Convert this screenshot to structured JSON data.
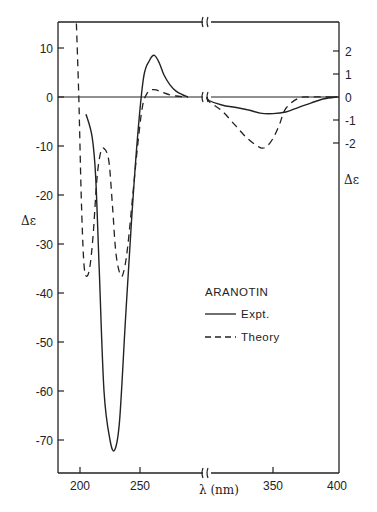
{
  "chart_data": {
    "type": "line",
    "title": "ARANOTIN",
    "xlabel": "λ (nm)",
    "ylabel": "Δε",
    "ylabel_right": "Δε",
    "xlim": [
      182,
      402
    ],
    "x_axis_break": 290,
    "x_ticks": [
      200,
      250,
      350,
      400
    ],
    "x_tick_labels": [
      "200",
      "250",
      "350",
      "400"
    ],
    "ylim_left": [
      -75,
      15
    ],
    "y_ticks_left": [
      10,
      0,
      -10,
      -20,
      -30,
      -40,
      -50,
      -60,
      -70
    ],
    "y_tick_labels_left": [
      "10",
      "0",
      "-10",
      "-20",
      "-30",
      "-40",
      "-50",
      "-60",
      "-70"
    ],
    "ylim_right": [
      -3,
      3
    ],
    "y_ticks_right": [
      2,
      1,
      0,
      -1,
      -2
    ],
    "y_tick_labels_right": [
      "2",
      "1",
      "0",
      "-1",
      "-2"
    ],
    "right_axis_applies_to": "λ > 290 nm (after axis break)",
    "grid": false,
    "legend_position": "inside lower-right",
    "legend_title": "ARANOTIN",
    "series": [
      {
        "name": "Expt.",
        "style": "solid",
        "x_left": [
          205,
          210,
          213,
          216,
          220,
          225,
          229,
          233,
          238,
          243,
          248,
          253,
          258,
          262,
          266,
          270,
          275,
          280,
          285,
          290
        ],
        "y_left": [
          -3.5,
          -8,
          -16,
          -35,
          -60,
          -70,
          -72,
          -66,
          -45,
          -25,
          -8,
          4,
          7.5,
          8.5,
          7,
          4.5,
          2.5,
          1.2,
          0.5,
          0
        ],
        "x_right": [
          290,
          300,
          310,
          320,
          330,
          340,
          350,
          360,
          370,
          380,
          390,
          400
        ],
        "y_right": [
          0,
          -0.15,
          -0.35,
          -0.45,
          -0.55,
          -0.7,
          -0.72,
          -0.65,
          -0.45,
          -0.25,
          -0.08,
          0
        ]
      },
      {
        "name": "Theory",
        "style": "dashed",
        "x_left": [
          197,
          199,
          201,
          203,
          205,
          208,
          211,
          214,
          217,
          220,
          224,
          227,
          230,
          234,
          237,
          240,
          244,
          248,
          252,
          256,
          260,
          264,
          268,
          274,
          280,
          286,
          290
        ],
        "y_left": [
          15,
          0,
          -20,
          -33,
          -36.5,
          -35,
          -28,
          -17,
          -11.5,
          -10.5,
          -13,
          -22,
          -32,
          -36.5,
          -35,
          -30,
          -20,
          -10,
          -2,
          0.8,
          1.5,
          1.4,
          1,
          0.5,
          0.2,
          0.05,
          0
        ],
        "x_right": [
          290,
          300,
          310,
          320,
          330,
          340,
          345,
          350,
          355,
          360,
          370,
          380,
          390,
          400
        ],
        "y_right": [
          0,
          -0.2,
          -0.6,
          -1.2,
          -1.8,
          -2.2,
          -2.15,
          -1.8,
          -1.2,
          -0.5,
          -0.05,
          0,
          0,
          0
        ]
      }
    ],
    "annotations": {
      "expt_min": {
        "x": 229,
        "y": -72
      },
      "expt_max": {
        "x": 262,
        "y": 8.5
      },
      "theory_min_1": {
        "x": 205,
        "y": -36.5
      },
      "theory_local_max": {
        "x": 220,
        "y": -10.5
      },
      "theory_min_2": {
        "x": 234,
        "y": -36.5
      },
      "theory_min_right": {
        "x": 340,
        "y": -2.2
      },
      "expt_min_right": {
        "x": 350,
        "y": -0.72
      }
    }
  },
  "labels": {
    "x_axis_title": "λ (nm)",
    "y_axis_title_left": "Δε",
    "y_axis_title_right": "Δε",
    "legend_title": "ARANOTIN",
    "legend_expt": "Expt.",
    "legend_theory": "Theory",
    "break_symbol": "≀≀"
  },
  "colors": {
    "line": "#222222",
    "background": "#ffffff"
  }
}
